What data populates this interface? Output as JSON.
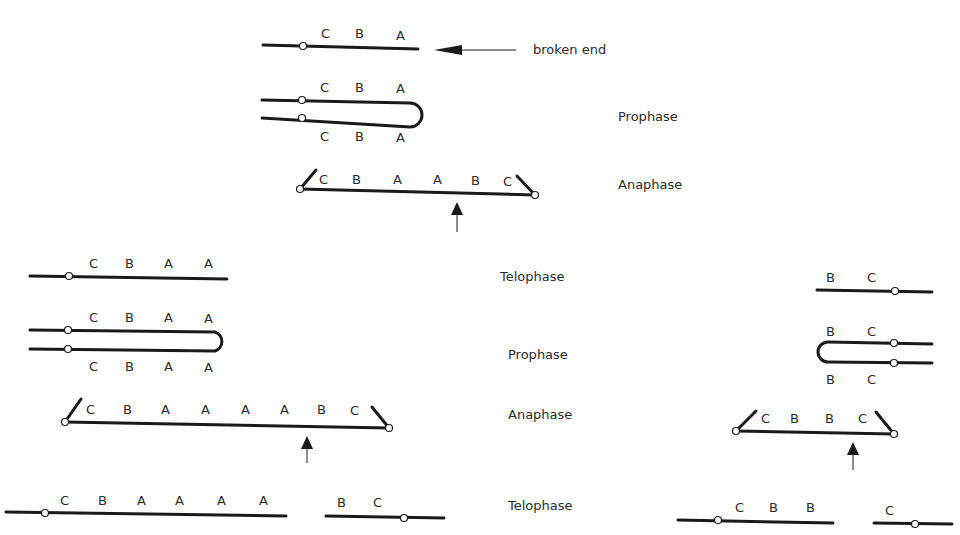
{
  "title_fragment": "",
  "annotation": {
    "broken_end_label": "broken end"
  },
  "phase_labels": {
    "row1": "",
    "row2": "Prophase",
    "row3": "Anaphase",
    "row4": "Telophase",
    "row5": "Prophase",
    "row6": "Anaphase",
    "row7": "Telophase"
  },
  "genes": {
    "r1": [
      "C",
      "B",
      "A"
    ],
    "r2_top": [
      "C",
      "B",
      "A"
    ],
    "r2_bottom": [
      "C",
      "B",
      "A"
    ],
    "r3": [
      "C",
      "B",
      "A",
      "A",
      "B",
      "C"
    ],
    "r4_left": [
      "C",
      "B",
      "A",
      "A"
    ],
    "r5_top": [
      "C",
      "B",
      "A",
      "A"
    ],
    "r5_bottom": [
      "C",
      "B",
      "A",
      "A"
    ],
    "r6_left": [
      "C",
      "B",
      "A",
      "A",
      "A",
      "A",
      "B",
      "C"
    ],
    "r7_left_a": [
      "C",
      "B",
      "A",
      "A",
      "A",
      "A"
    ],
    "r7_left_b": [
      "B",
      "C"
    ],
    "r4_right": [
      "B",
      "C"
    ],
    "r5_right_top": [
      "B",
      "C"
    ],
    "r5_right_bottom": [
      "B",
      "C"
    ],
    "r6_right": [
      "C",
      "B",
      "B",
      "C"
    ],
    "r7_right_a": [
      "C",
      "B",
      "B"
    ],
    "r7_right_b": [
      "C"
    ]
  }
}
